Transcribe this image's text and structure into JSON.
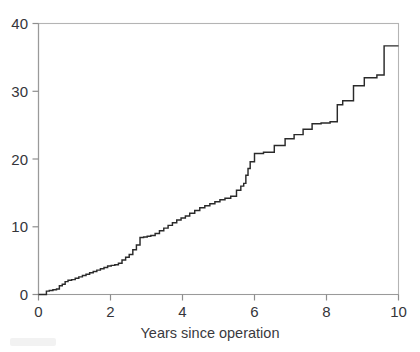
{
  "figure": {
    "background_color": "#ffffff",
    "curve_color": "#2a2a2a",
    "frame_color": "#b4b4b4",
    "axis_color": "#9a9a9a",
    "label_color": "#35353a"
  },
  "axes": {
    "x_title": "Years since operation",
    "y_title": "",
    "x_ticks": [
      "0",
      "2",
      "4",
      "6",
      "8",
      "10"
    ],
    "y_ticks": [
      "0",
      "10",
      "20",
      "30",
      "40"
    ]
  },
  "chart_data": {
    "type": "line",
    "subtype": "step",
    "title": "",
    "subtitle": "",
    "xlabel": "Years since operation",
    "ylabel": "",
    "xlim": [
      0,
      10
    ],
    "ylim": [
      0,
      40
    ],
    "xticks": [
      0,
      2,
      4,
      6,
      8,
      10
    ],
    "yticks": [
      0,
      10,
      20,
      30,
      40
    ],
    "grid": false,
    "legend": null,
    "annotations": [],
    "series": [
      {
        "name": "Cumulative incidence",
        "step_mode": "post",
        "x": [
          0.0,
          0.12,
          0.22,
          0.3,
          0.4,
          0.5,
          0.58,
          0.66,
          0.74,
          0.82,
          0.92,
          1.02,
          1.12,
          1.22,
          1.32,
          1.42,
          1.52,
          1.62,
          1.72,
          1.82,
          1.92,
          2.02,
          2.12,
          2.22,
          2.32,
          2.42,
          2.52,
          2.62,
          2.72,
          2.82,
          2.92,
          3.02,
          3.12,
          3.24,
          3.36,
          3.48,
          3.6,
          3.72,
          3.84,
          3.96,
          4.08,
          4.2,
          4.34,
          4.48,
          4.62,
          4.76,
          4.9,
          5.04,
          5.18,
          5.34,
          5.5,
          5.62,
          5.7,
          5.76,
          5.82,
          5.88,
          6.0,
          6.25,
          6.55,
          6.85,
          7.1,
          7.35,
          7.6,
          7.85,
          8.1,
          8.3,
          8.45,
          8.75,
          9.05,
          9.4,
          9.6,
          10.0
        ],
        "y": [
          0.0,
          0.0,
          0.5,
          0.6,
          0.7,
          0.8,
          1.3,
          1.5,
          1.9,
          2.1,
          2.2,
          2.4,
          2.6,
          2.8,
          3.0,
          3.2,
          3.4,
          3.6,
          3.8,
          4.0,
          4.2,
          4.3,
          4.4,
          4.6,
          5.1,
          5.5,
          5.9,
          6.6,
          7.3,
          8.4,
          8.5,
          8.6,
          8.7,
          9.0,
          9.4,
          9.8,
          10.2,
          10.6,
          11.0,
          11.3,
          11.6,
          12.0,
          12.4,
          12.8,
          13.1,
          13.4,
          13.7,
          14.0,
          14.2,
          14.5,
          15.4,
          16.0,
          16.4,
          17.6,
          18.6,
          19.6,
          20.8,
          21.0,
          22.0,
          23.0,
          23.6,
          24.4,
          25.2,
          25.3,
          25.5,
          28.0,
          28.6,
          30.8,
          32.0,
          32.4,
          36.7,
          36.7
        ]
      }
    ]
  }
}
